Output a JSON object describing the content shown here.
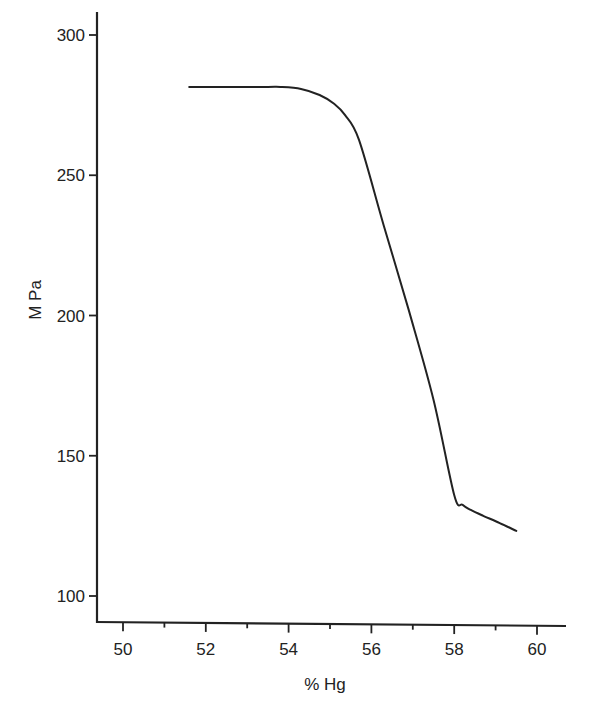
{
  "chart_data": {
    "type": "line",
    "title": "",
    "xlabel": "% Hg",
    "ylabel": "M Pa",
    "xlim": [
      49.35,
      60.7
    ],
    "ylim": [
      91,
      310
    ],
    "x_ticks": [
      50,
      52,
      54,
      56,
      58,
      60
    ],
    "x_minor_ticks": [
      51,
      53,
      55,
      57,
      59
    ],
    "y_ticks": [
      100,
      150,
      200,
      250,
      300
    ],
    "grid": false,
    "legend": null,
    "series": [
      {
        "name": "M Pa vs % Hg",
        "color": "#222222",
        "x": [
          51.6,
          52.5,
          53.5,
          53.8,
          54.3,
          54.75,
          55.1,
          55.36,
          55.7,
          56.3,
          56.9,
          57.5,
          58.0,
          58.2,
          58.4,
          58.7,
          59.1,
          59.5
        ],
        "y": [
          281.5,
          281.5,
          281.5,
          281.5,
          280.8,
          278.6,
          275.5,
          271.5,
          262.6,
          232.0,
          202.0,
          170.0,
          136.0,
          132.5,
          130.7,
          128.6,
          126.0,
          123.2
        ]
      }
    ]
  }
}
